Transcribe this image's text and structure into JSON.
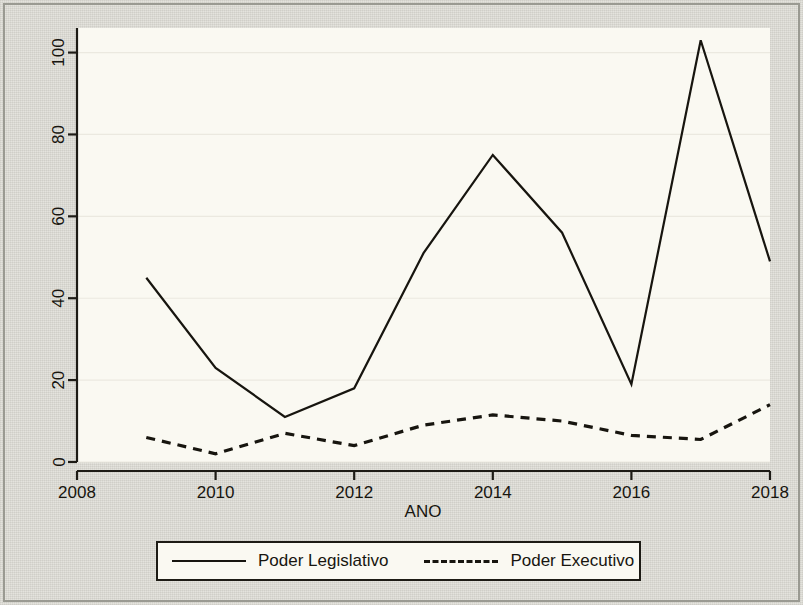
{
  "chart_data": {
    "type": "line",
    "title": "",
    "xlabel": "ANO",
    "ylabel": "",
    "x": [
      2009,
      2010,
      2011,
      2012,
      2013,
      2014,
      2015,
      2016,
      2017,
      2018
    ],
    "series": [
      {
        "name": "Poder Legislativo",
        "style": "solid",
        "values": [
          45,
          23,
          11,
          18,
          51,
          75,
          56,
          19,
          103,
          49
        ]
      },
      {
        "name": "Poder Executivo",
        "style": "dashed",
        "values": [
          6,
          2,
          7,
          4,
          9,
          11.5,
          10,
          6.5,
          5.5,
          14
        ]
      }
    ],
    "xlim": [
      2008,
      2018
    ],
    "ylim": [
      0,
      106
    ],
    "xticks": [
      "2008",
      "2010",
      "2012",
      "2014",
      "2016",
      "2018"
    ],
    "xtick_values": [
      2008,
      2010,
      2012,
      2014,
      2016,
      2018
    ],
    "yticks": [
      "0",
      "20",
      "40",
      "60",
      "80",
      "100"
    ],
    "ytick_values": [
      0,
      20,
      40,
      60,
      80,
      100
    ],
    "grid": "horizontal",
    "legend_position": "bottom",
    "colors": {
      "line": "#17150f",
      "plot_background": "#faf9f2",
      "page_background": "#e4e3dd",
      "gridline": "#ebe9e0",
      "axis": "#1d1b15"
    }
  },
  "axes": {
    "x_axis_title": "ANO"
  },
  "legend": {
    "entries": [
      {
        "label": "Poder Legislativo",
        "key": "solid-line-key"
      },
      {
        "label": "Poder Executivo",
        "key": "dashed-line-key"
      }
    ]
  }
}
